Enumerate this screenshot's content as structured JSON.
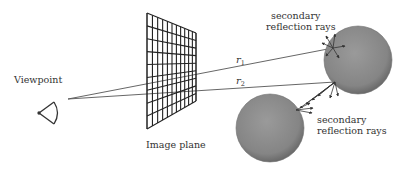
{
  "diagram": {
    "labels": {
      "viewpoint": "Viewpoint",
      "image_plane": "Image plane",
      "secondary_top_line1": "secondary",
      "secondary_top_line2": "reflection rays",
      "secondary_bottom_line1": "secondary",
      "secondary_bottom_line2": "reflection rays",
      "ray1_symbol": "r",
      "ray1_subscript": "1",
      "ray2_symbol": "r",
      "ray2_subscript": "2"
    },
    "image_plane_grid": {
      "rows": 9,
      "columns": 11
    },
    "objects": [
      {
        "name": "sphere-upper-right",
        "cx": 358,
        "cy": 60,
        "r": 34
      },
      {
        "name": "sphere-lower-left",
        "cx": 270,
        "cy": 128,
        "r": 34
      }
    ],
    "colors": {
      "line": "#333333",
      "sphere_fill": "#8a8a8a",
      "sphere_edge": "#6e6e6e",
      "text": "#333333",
      "background": "#ffffff"
    }
  }
}
